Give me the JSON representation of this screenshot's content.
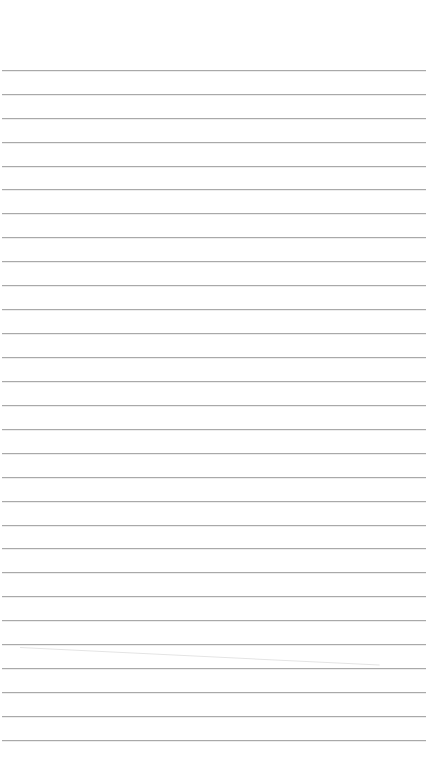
{
  "page": {
    "type": "lined-paper",
    "background_color": "#ffffff",
    "line_color": "#a9a9a9",
    "line_count": 29,
    "first_line_y": 70,
    "line_spacing": 23.93
  },
  "rules": [
    70,
    94,
    118,
    142,
    166,
    189,
    213,
    237,
    261,
    285,
    309,
    333,
    357,
    381,
    405,
    429,
    453,
    477,
    501,
    525,
    548,
    572,
    596,
    620,
    644,
    668,
    692,
    716,
    740
  ]
}
